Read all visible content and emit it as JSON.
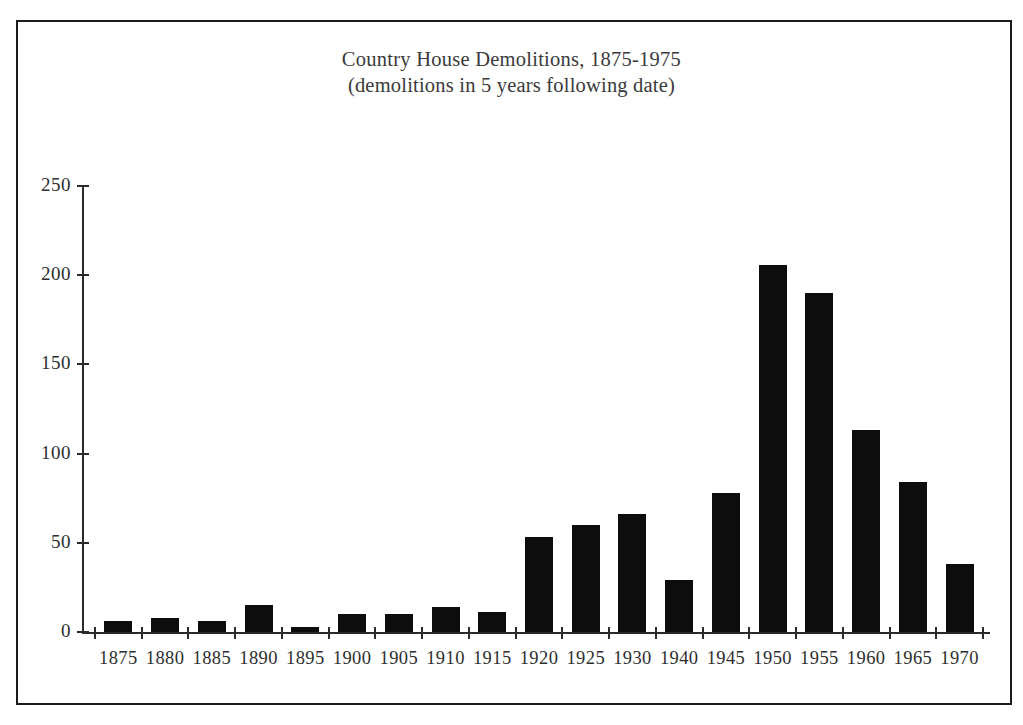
{
  "chart_data": {
    "type": "bar",
    "title": "Country House Demolitions, 1875-1975",
    "subtitle": "(demolitions in 5 years following date)",
    "xlabel": "",
    "ylabel": "",
    "categories": [
      "1875",
      "1880",
      "1885",
      "1890",
      "1895",
      "1900",
      "1905",
      "1910",
      "1915",
      "1920",
      "1925",
      "1930",
      "1940",
      "1945",
      "1950",
      "1955",
      "1960",
      "1965",
      "1970"
    ],
    "values": [
      6,
      8,
      6,
      15,
      3,
      10,
      10,
      14,
      11,
      53,
      60,
      66,
      29,
      78,
      206,
      190,
      113,
      84,
      38
    ],
    "ylim": [
      0,
      250
    ],
    "yticks": [
      0,
      50,
      100,
      150,
      200,
      250
    ],
    "ytick_labels": [
      "0",
      "50",
      "100",
      "150",
      "200",
      "250"
    ],
    "grid": false,
    "legend": null,
    "bar_color": "#0d0d0d",
    "axis_color": "#2a2a2a",
    "text_color": "#2e2e2e",
    "note": "x category 1935 is absent from the axis"
  },
  "figure": {
    "frame_color": "#1b1b1b",
    "background": "#ffffff"
  }
}
